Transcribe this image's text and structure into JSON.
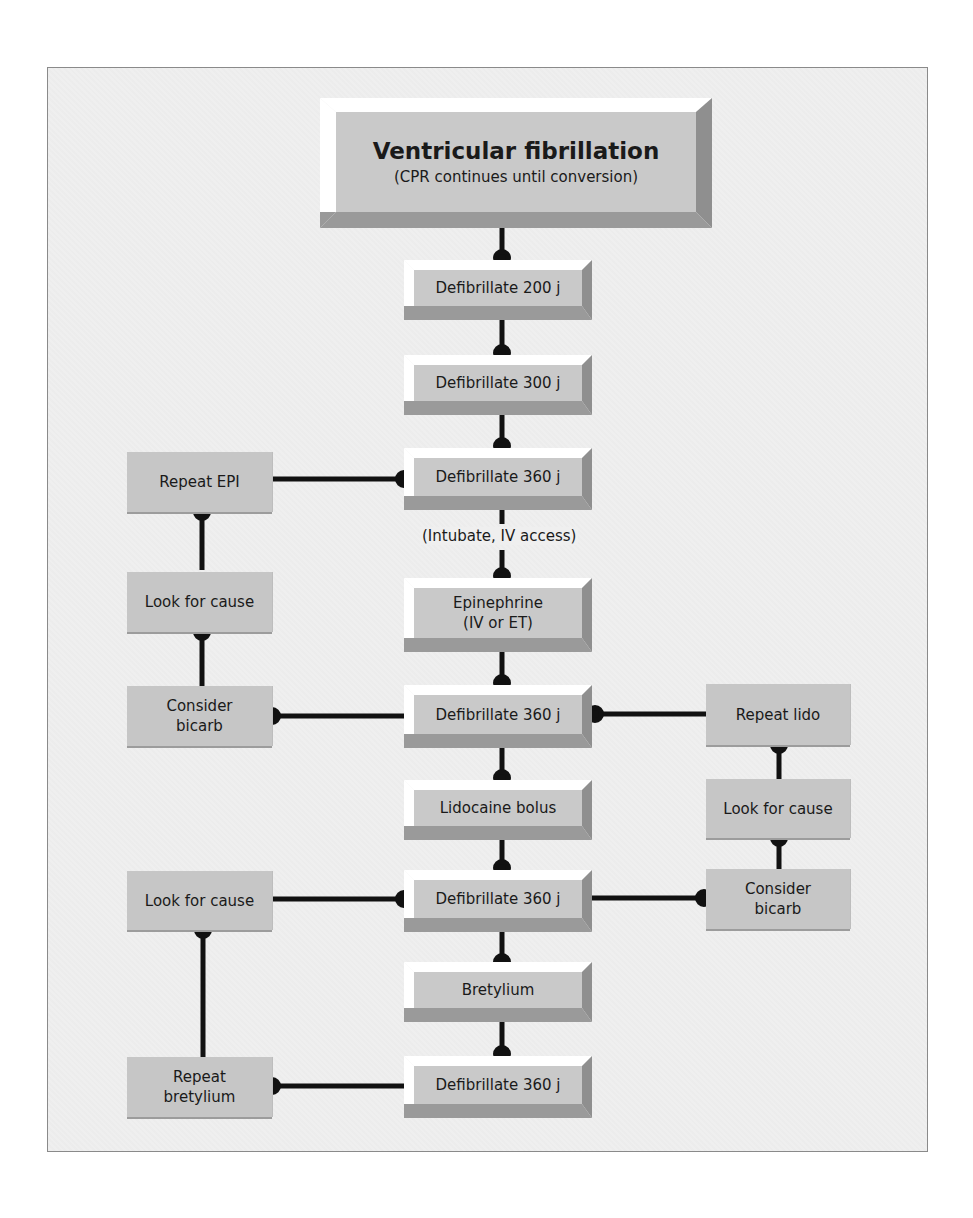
{
  "diagram": {
    "title": "Ventricular fibrillation",
    "subtitle": "(CPR continues until conversion)",
    "main_steps": [
      {
        "id": "defib-200",
        "label": "Defibrillate 200 j"
      },
      {
        "id": "defib-300",
        "label": "Defibrillate 300 j"
      },
      {
        "id": "defib-360-1",
        "label": "Defibrillate 360 j"
      },
      {
        "id": "intubate-note",
        "label": "(Intubate, IV access)"
      },
      {
        "id": "epinephrine",
        "label": "Epinephrine",
        "label2": "(IV or ET)"
      },
      {
        "id": "defib-360-2",
        "label": "Defibrillate 360 j"
      },
      {
        "id": "lidocaine",
        "label": "Lidocaine bolus"
      },
      {
        "id": "defib-360-3",
        "label": "Defibrillate 360 j"
      },
      {
        "id": "bretylium",
        "label": "Bretylium"
      },
      {
        "id": "defib-360-4",
        "label": "Defibrillate 360 j"
      }
    ],
    "left_branch_1": [
      {
        "id": "repeat-epi",
        "label": "Repeat EPI"
      },
      {
        "id": "look-for-cause-l1",
        "label": "Look for cause"
      },
      {
        "id": "consider-bicarb-l1",
        "label": "Consider",
        "label2": "bicarb"
      }
    ],
    "right_branch": [
      {
        "id": "repeat-lido",
        "label": "Repeat lido"
      },
      {
        "id": "look-for-cause-r",
        "label": "Look for cause"
      },
      {
        "id": "consider-bicarb-r",
        "label": "Consider",
        "label2": "bicarb"
      }
    ],
    "left_branch_2": [
      {
        "id": "look-for-cause-l2",
        "label": "Look for cause"
      },
      {
        "id": "repeat-bretylium",
        "label": "Repeat",
        "label2": "bretylium"
      }
    ],
    "colors": {
      "box_face": "#c9c9c9",
      "bevel_light": "#ffffff",
      "bevel_dark": "#8f8f8f",
      "connector": "#111111",
      "background": "#efefef"
    }
  }
}
